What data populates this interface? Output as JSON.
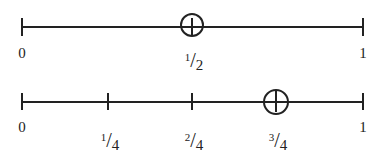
{
  "diagram": {
    "type": "number-lines",
    "line_color": "#222222",
    "lines": [
      {
        "range": [
          0,
          1
        ],
        "ticks": [
          {
            "value": "0",
            "label": "0"
          },
          {
            "value": "1/2",
            "num": "1",
            "den": "2",
            "circled": true
          },
          {
            "value": "1",
            "label": "1"
          }
        ]
      },
      {
        "range": [
          0,
          1
        ],
        "ticks": [
          {
            "value": "0",
            "label": "0"
          },
          {
            "value": "1/4",
            "num": "1",
            "den": "4"
          },
          {
            "value": "2/4",
            "num": "2",
            "den": "4"
          },
          {
            "value": "3/4",
            "num": "3",
            "den": "4",
            "circled": true
          },
          {
            "value": "1",
            "label": "1"
          }
        ]
      }
    ]
  }
}
